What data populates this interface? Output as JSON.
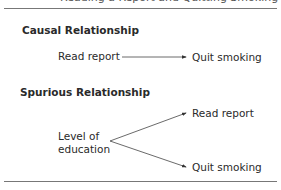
{
  "caption_fragment": "Reading a Report and Quitting Smoking",
  "causal": {
    "heading": "Causal Relationship",
    "from": "Read report",
    "to": "Quit smoking"
  },
  "spurious": {
    "heading": "Spurious Relationship",
    "source_line1": "Level of",
    "source_line2": "education",
    "target_top": "Read report",
    "target_bottom": "Quit smoking"
  }
}
